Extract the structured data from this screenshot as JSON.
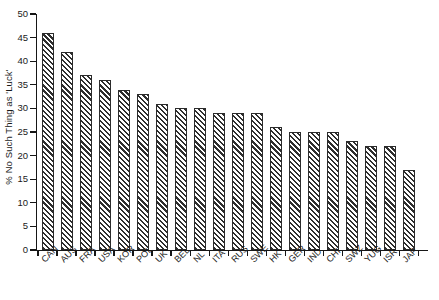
{
  "chart_data": {
    "type": "bar",
    "title": "",
    "xlabel": "",
    "ylabel": "% No Such Thing as 'Luck'",
    "ylim": [
      0,
      50
    ],
    "yticks": [
      0,
      5,
      10,
      15,
      20,
      25,
      30,
      35,
      40,
      45,
      50
    ],
    "grid": false,
    "legend": null,
    "categories": [
      "CAN",
      "AUS",
      "FRA",
      "USA",
      "KOR",
      "POL",
      "UK",
      "BEL",
      "NL",
      "ITA",
      "RUS",
      "SWE",
      "HK",
      "GER",
      "IND",
      "CHI",
      "SWZ",
      "YUG",
      "ISR",
      "JAP"
    ],
    "values": [
      46,
      42,
      37,
      36,
      34,
      33,
      31,
      30,
      30,
      29,
      29,
      29,
      26,
      25,
      25,
      25,
      23,
      22,
      22,
      17
    ],
    "bar_style": {
      "fill": "#ffffff",
      "edge": "#2b2b2b",
      "hatch": "diagonal-forward-slash"
    },
    "axis_color": "#161616"
  }
}
